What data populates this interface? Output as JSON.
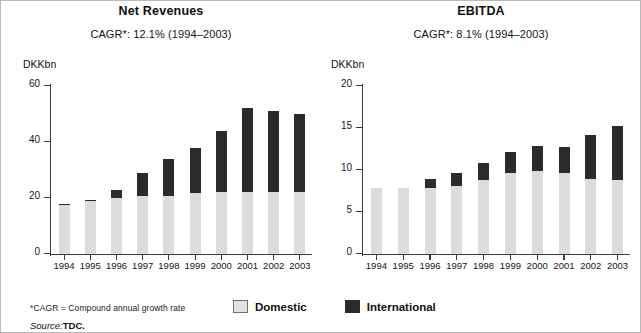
{
  "footer": {
    "footnote": "*CAGR = Compound annual growth rate",
    "source_label": "Source:",
    "source_value": "TDC.",
    "legend": [
      {
        "name": "domestic",
        "label": "Domestic",
        "color": "#dcdcdc"
      },
      {
        "name": "international",
        "label": "International",
        "color": "#2b2b2b"
      }
    ]
  },
  "chart_data": [
    {
      "id": "net-revenues",
      "type": "bar",
      "stacked": true,
      "title": "Net Revenues",
      "subtitle": "CAGR*: 12.1% (1994–2003)",
      "cagr": "12.1%",
      "cagr_period": "1994–2003",
      "ylabel": "DKKbn",
      "xlabel": "",
      "ylim": [
        0,
        60
      ],
      "yticks": [
        0,
        20,
        40,
        60
      ],
      "grid": false,
      "legend_position": "bottom",
      "categories": [
        "1994",
        "1995",
        "1996",
        "1997",
        "1998",
        "1999",
        "2000",
        "2001",
        "2002",
        "2003"
      ],
      "series": [
        {
          "name": "Domestic",
          "color": "#dcdcdc",
          "values": [
            17.5,
            19.0,
            20.0,
            20.8,
            20.7,
            21.8,
            22.2,
            22.3,
            22.3,
            22.0
          ]
        },
        {
          "name": "International",
          "color": "#2b2b2b",
          "values": [
            0.5,
            0.3,
            3.0,
            8.2,
            13.3,
            16.2,
            21.8,
            29.7,
            28.7,
            28.0
          ]
        }
      ],
      "totals": [
        18.0,
        19.3,
        23.0,
        29.0,
        34.0,
        38.0,
        44.0,
        52.0,
        51.0,
        50.0
      ]
    },
    {
      "id": "ebitda",
      "type": "bar",
      "stacked": true,
      "title": "EBITDA",
      "subtitle": "CAGR*: 8.1% (1994–2003)",
      "cagr": "8.1%",
      "cagr_period": "1994–2003",
      "ylabel": "DKKbn",
      "xlabel": "",
      "ylim": [
        0,
        20
      ],
      "yticks": [
        0,
        5,
        10,
        15,
        20
      ],
      "grid": false,
      "legend_position": "bottom",
      "categories": [
        "1994",
        "1995",
        "1996",
        "1997",
        "1998",
        "1999",
        "2000",
        "2001",
        "2002",
        "2003"
      ],
      "series": [
        {
          "name": "Domestic",
          "color": "#dcdcdc",
          "values": [
            7.8,
            7.9,
            7.8,
            8.1,
            8.8,
            9.6,
            9.9,
            9.6,
            8.9,
            8.8
          ]
        },
        {
          "name": "International",
          "color": "#2b2b2b",
          "values": [
            0.0,
            0.0,
            1.1,
            1.6,
            2.0,
            2.5,
            3.0,
            3.1,
            5.3,
            6.4
          ]
        }
      ],
      "totals": [
        7.8,
        7.9,
        8.9,
        9.7,
        10.8,
        12.1,
        12.9,
        12.7,
        14.2,
        15.2
      ]
    }
  ]
}
